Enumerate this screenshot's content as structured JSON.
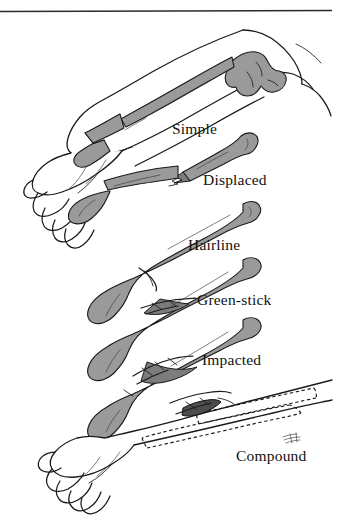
{
  "figure": {
    "background_color": "#ffffff",
    "ink_color": "#1a1a1a",
    "bone_fill_color": "#9a9a9a",
    "bone_shadow_color": "#7c7c7c",
    "top_rule": {
      "name": "top-divider-rule",
      "x_start": 0,
      "x_end": 332,
      "y": 11,
      "thickness": 1.6,
      "color": "#2b2b2b"
    },
    "artist_signature": "artist-signature-scribble"
  },
  "labels": {
    "simple": "Simple",
    "displaced": "Displaced",
    "hairline": "Hairline",
    "green_stick": "Green-stick",
    "impacted": "Impacted",
    "compound": "Compound"
  },
  "illustrations": [
    {
      "id": "simple",
      "label": "Simple",
      "kind": "forearm-with-hand",
      "description": "Full forearm and loosely closed hand seen from the side, elbow at upper right, with radius and ulna shaded gray and a clean transverse break in the shaft."
    },
    {
      "id": "displaced",
      "label": "Displaced",
      "kind": "isolated-bone",
      "description": "Single shaded bone shaft broken cleanly into two pieces that are offset and no longer aligned."
    },
    {
      "id": "hairline",
      "label": "Hairline",
      "kind": "isolated-bone",
      "description": "Single shaded bone shaft with a thin crack line that does not separate the fragments."
    },
    {
      "id": "green_stick",
      "label": "Green-stick",
      "kind": "isolated-bone",
      "description": "Single shaded bone shaft with an incomplete split along one side, bone bent but not fully broken."
    },
    {
      "id": "impacted",
      "label": "Impacted",
      "kind": "isolated-bone",
      "description": "Single shaded bone shaft with jagged fragments driven into each other at the fracture site."
    },
    {
      "id": "compound",
      "label": "Compound",
      "kind": "forearm-with-hand",
      "description": "Full forearm and hand in outline; dashed lines show the bones inside the limb and a dark bone fragment pierces outward through the skin."
    }
  ]
}
